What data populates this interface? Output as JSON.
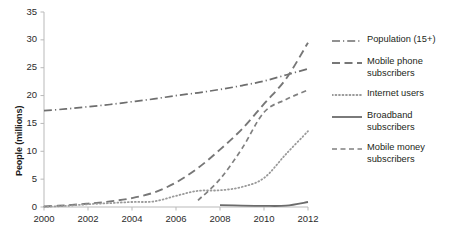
{
  "chart_data": {
    "type": "line",
    "title": "",
    "xlabel": "",
    "ylabel": "People (millions)",
    "xlim": [
      2000,
      2012
    ],
    "ylim": [
      0,
      35
    ],
    "ytick_step": 5,
    "xtick_step": 2,
    "grid": false,
    "legend_position": "right",
    "xticks": [
      "2000",
      "2002",
      "2004",
      "2006",
      "2008",
      "2010",
      "2012"
    ],
    "yticks": [
      "0",
      "5",
      "10",
      "15",
      "20",
      "25",
      "30",
      "35"
    ],
    "x": [
      2000,
      2001,
      2002,
      2003,
      2004,
      2005,
      2006,
      2007,
      2008,
      2009,
      2010,
      2011,
      2012
    ],
    "series": [
      {
        "name": "Population (15+)",
        "style": "dash-dot",
        "color": "#6e6e6e",
        "values": [
          17.3,
          17.6,
          18.0,
          18.4,
          18.9,
          19.4,
          20.0,
          20.5,
          21.1,
          21.8,
          22.6,
          23.7,
          24.8
        ]
      },
      {
        "name": "Mobile phone subscribers",
        "style": "long-dash",
        "color": "#777777",
        "values": [
          0.1,
          0.3,
          0.6,
          1.0,
          1.6,
          2.6,
          4.4,
          7.0,
          10.3,
          14.0,
          18.5,
          23.0,
          29.5
        ]
      },
      {
        "name": "Internet users",
        "style": "dotted",
        "color": "#9a9a9a",
        "values": [
          0.05,
          0.2,
          0.5,
          0.7,
          0.9,
          1.0,
          2.0,
          2.9,
          3.0,
          3.6,
          5.2,
          9.5,
          13.6
        ]
      },
      {
        "name": "Broadband subscribers",
        "style": "solid",
        "color": "#6b6b6b",
        "values": [
          null,
          null,
          null,
          null,
          null,
          null,
          null,
          null,
          0.35,
          0.25,
          0.2,
          0.25,
          0.9
        ]
      },
      {
        "name": "Mobile money subscribers",
        "style": "dash",
        "color": "#808080",
        "values": [
          null,
          null,
          null,
          null,
          null,
          null,
          null,
          1.2,
          5.0,
          10.5,
          17.0,
          19.3,
          21.0
        ]
      }
    ]
  },
  "axis": {
    "y_title": "People (millions)"
  },
  "legend": {
    "items": [
      {
        "label": "Population (15+)",
        "style": "dash-dot"
      },
      {
        "label": "Mobile phone\nsubscribers",
        "style": "long-dash"
      },
      {
        "label": "Internet users",
        "style": "dotted"
      },
      {
        "label": "Broadband\nsubscribers",
        "style": "solid"
      },
      {
        "label": "Mobile money\nsubscribers",
        "style": "dash"
      }
    ]
  }
}
